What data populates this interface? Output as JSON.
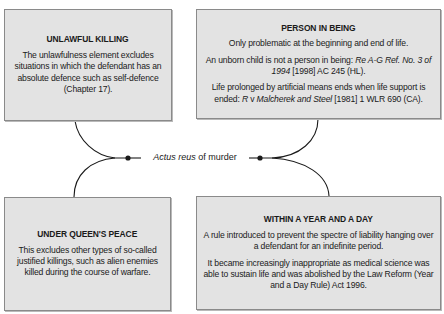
{
  "diagram": {
    "center": {
      "label_italic": "Actus reus",
      "label_rest": " of murder"
    },
    "boxes": {
      "unlawful_killing": {
        "title": "UNLAWFUL KILLING",
        "body": "The unlawfulness element excludes situations in which the defendant has an absolute defence such as self-defence (Chapter 17)."
      },
      "person_in_being": {
        "title": "PERSON IN BEING",
        "para1": "Only problematic at the beginning and end of life.",
        "para2_text": "An unborn child is not a person in being: ",
        "para2_case_italic": "Re A-G Ref. No. 3 of 1994",
        "para2_citation": " [1998] AC 245 (HL).",
        "para3_text": "Life prolonged by artificial means ends when life support is ended: ",
        "para3_case_r": "R",
        "para3_case_v": " v ",
        "para3_case_italic": "Malcherek and Steel",
        "para3_citation": " [1981] 1 WLR 690 (CA)."
      },
      "under_queens_peace": {
        "title": "UNDER QUEEN'S PEACE",
        "body": "This excludes other types of so-called justified killings, such as alien enemies killed during the course of warfare."
      },
      "within_a_year_and_a_day": {
        "title": "WITHIN A YEAR AND A DAY",
        "para1": "A rule introduced to prevent the spectre of liability hanging over a defendant for an indefinite period.",
        "para2": "It became increasingly inappropriate as medical science was able to sustain life and was abolished by the Law Reform (Year and a Day Rule) Act 1996."
      }
    },
    "colors": {
      "box_fill": "#e3e3e3",
      "box_border": "#8a8a8a",
      "line": "#1a1a1a"
    }
  }
}
